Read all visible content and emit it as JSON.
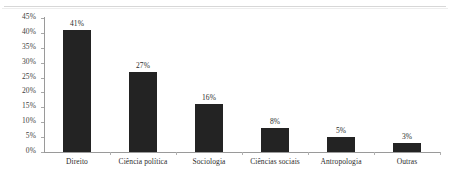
{
  "chart_data": {
    "type": "bar",
    "title": "",
    "subtitle": "",
    "xlabel": "",
    "ylabel": "",
    "categories": [
      "Direito",
      "Ciência política",
      "Sociologia",
      "Ciências sociais",
      "Antropologia",
      "Outras"
    ],
    "values": [
      41,
      27,
      16,
      8,
      5,
      3
    ],
    "value_labels": [
      "41%",
      "27%",
      "16%",
      "8%",
      "5%",
      "3%"
    ],
    "ylim": [
      0,
      45
    ],
    "ytick_values": [
      0,
      5,
      10,
      15,
      20,
      25,
      30,
      35,
      40,
      45
    ],
    "ytick_labels": [
      "0%",
      "5%",
      "10%",
      "15%",
      "20%",
      "25%",
      "30%",
      "35%",
      "40%",
      "45%"
    ],
    "grid": false,
    "legend": false,
    "bar_color": "#232323",
    "axis_color": "#9a9a9a",
    "background": "#ffffff"
  }
}
